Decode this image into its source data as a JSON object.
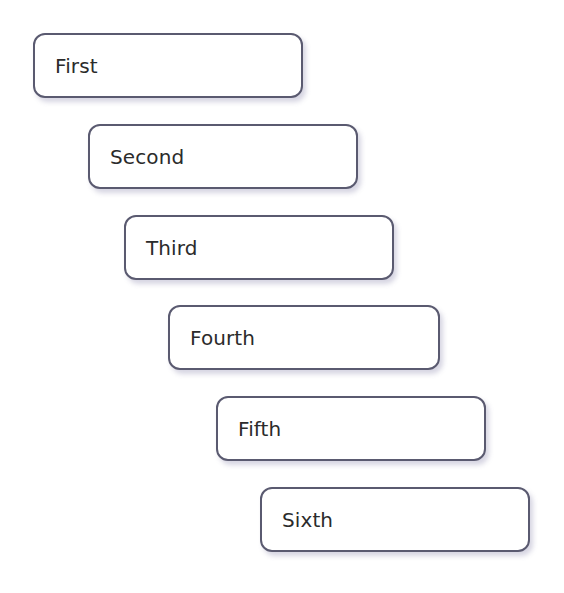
{
  "canvas": {
    "width": 564,
    "height": 593,
    "background_color": "#ffffff"
  },
  "diagram": {
    "type": "staircase-flow",
    "style": {
      "border_color": "#5a5a70",
      "border_width": 2,
      "corner_radius": 12,
      "fill_color": "#ffffff",
      "text_color": "#2b2b2b",
      "shadow_color": "#7873a0",
      "font_size": 20,
      "box_width": 270,
      "box_height": 65,
      "horizontal_step": 45,
      "vertical_step": 91
    },
    "steps": [
      {
        "label": "First",
        "x": 33,
        "y": 33,
        "width": 270,
        "height": 65,
        "order": 1
      },
      {
        "label": "Second",
        "x": 88,
        "y": 124,
        "width": 270,
        "height": 65,
        "order": 2
      },
      {
        "label": "Third",
        "x": 124,
        "y": 215,
        "width": 270,
        "height": 65,
        "order": 3
      },
      {
        "label": "Fourth",
        "x": 168,
        "y": 305,
        "width": 272,
        "height": 65,
        "order": 4
      },
      {
        "label": "Fifth",
        "x": 216,
        "y": 396,
        "width": 270,
        "height": 65,
        "order": 5
      },
      {
        "label": "Sixth",
        "x": 260,
        "y": 487,
        "width": 270,
        "height": 65,
        "order": 6
      }
    ]
  }
}
